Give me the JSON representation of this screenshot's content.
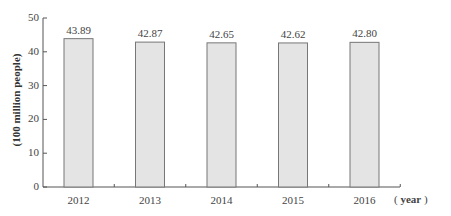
{
  "chart_data": {
    "type": "bar",
    "title": "",
    "xlabel": "( year )",
    "ylabel": "(100 million people)",
    "categories": [
      "2012",
      "2013",
      "2014",
      "2015",
      "2016"
    ],
    "values": [
      43.89,
      42.87,
      42.65,
      42.62,
      42.8
    ],
    "value_labels": [
      "43.89",
      "42.87",
      "42.65",
      "42.62",
      "42.80"
    ],
    "ylim": [
      0,
      50
    ],
    "yticks": [
      "0",
      "10",
      "20",
      "30",
      "40",
      "50"
    ],
    "grid": false,
    "legend": null,
    "bar_color": "#e4e4e4",
    "bar_edge_color": "#777777"
  },
  "axis": {
    "y_title": "(100 million people)",
    "x_unit_open": "(",
    "x_unit": "year",
    "x_unit_close": ")"
  }
}
